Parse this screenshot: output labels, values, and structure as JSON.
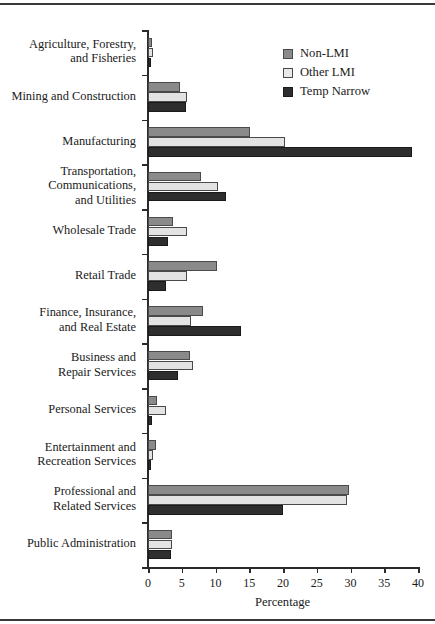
{
  "chart_data": {
    "type": "bar",
    "orientation": "horizontal",
    "title": "",
    "xlabel": "Percentage",
    "ylabel": "",
    "xlim": [
      0,
      40
    ],
    "xticks": [
      0,
      5,
      10,
      15,
      20,
      25,
      30,
      35,
      40
    ],
    "grid": false,
    "legend_position": "top-right",
    "categories": [
      "Agriculture, Forestry,\nand Fisheries",
      "Mining and Construction",
      "Manufacturing",
      "Transportation,\nCommunications,\nand Utilities",
      "Wholesale Trade",
      "Retail Trade",
      "Finance, Insurance,\nand Real Estate",
      "Business and\nRepair Services",
      "Personal Services",
      "Entertainment and\nRecreation Services",
      "Professional and\nRelated Services",
      "Public Administration"
    ],
    "category_lines": [
      [
        "Agriculture, Forestry,",
        "and Fisheries"
      ],
      [
        "Mining and Construction"
      ],
      [
        "Manufacturing"
      ],
      [
        "Transportation,",
        "Communications,",
        "and Utilities"
      ],
      [
        "Wholesale Trade"
      ],
      [
        "Retail Trade"
      ],
      [
        "Finance, Insurance,",
        "and Real Estate"
      ],
      [
        "Business and",
        "Repair Services"
      ],
      [
        "Personal Services"
      ],
      [
        "Entertainment and",
        "Recreation Services"
      ],
      [
        "Professional and",
        "Related Services"
      ],
      [
        "Public Administration"
      ]
    ],
    "series": [
      {
        "name": "Non-LMI",
        "color": "#8a8a8a",
        "values": [
          0.6,
          4.8,
          15.1,
          7.8,
          3.7,
          10.2,
          8.2,
          6.2,
          1.3,
          1.2,
          29.8,
          3.6
        ]
      },
      {
        "name": "Other LMI",
        "color": "#e3e3e3",
        "values": [
          0.7,
          5.8,
          20.3,
          10.4,
          5.8,
          5.8,
          6.3,
          6.7,
          2.6,
          0.8,
          29.5,
          3.5
        ]
      },
      {
        "name": "Temp Narrow",
        "color": "#2e2e2e",
        "values": [
          0.5,
          5.6,
          39.1,
          11.6,
          3.0,
          2.7,
          13.8,
          4.4,
          0.6,
          0.4,
          20.0,
          3.4
        ]
      }
    ]
  },
  "legend": {
    "items": [
      {
        "label": "Non-LMI",
        "swatch": "series-0-swatch"
      },
      {
        "label": "Other LMI",
        "swatch": "series-1-swatch"
      },
      {
        "label": "Temp Narrow",
        "swatch": "series-2-swatch"
      }
    ]
  },
  "axis": {
    "x_title": "Percentage",
    "x_tick_labels": [
      "0",
      "5",
      "10",
      "15",
      "20",
      "25",
      "30",
      "35",
      "40"
    ]
  }
}
